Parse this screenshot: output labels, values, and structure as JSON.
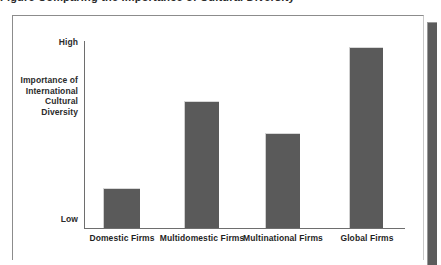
{
  "clipped_heading": "Figure   Comparing the Importance of Cultural Diversity",
  "chart_data": {
    "type": "bar",
    "title": "",
    "xlabel": "",
    "ylabel": "Importance of International Cultural Diversity",
    "ylabel_lines": [
      "Importance of",
      "International",
      "Cultural",
      "Diversity"
    ],
    "categories": [
      "Domestic Firms",
      "Multidomestic Firms",
      "Multinational Firms",
      "Global Firms"
    ],
    "values": [
      21,
      68,
      51,
      96
    ],
    "ylim": [
      0,
      100
    ],
    "ytick_labels": [
      "High",
      "Low"
    ],
    "ytick_values": [
      100,
      0
    ],
    "grid": false,
    "legend": false,
    "bar_color": "#5a5a5a",
    "axis_color": "#6e6e6e"
  },
  "bars": [
    {
      "label": "Domestic Firms",
      "left": 103,
      "top": 188,
      "width": 37,
      "height": 40
    },
    {
      "label": "Multidomestic Firms",
      "left": 184,
      "top": 101,
      "width": 35,
      "height": 127
    },
    {
      "label": "Multinational Firms",
      "left": 265,
      "top": 133,
      "width": 35,
      "height": 95
    },
    {
      "label": "Global Firms",
      "left": 349,
      "top": 47,
      "width": 34,
      "height": 181
    }
  ],
  "category_labels": [
    {
      "text": "Domestic Firms",
      "left": 77,
      "width": 90
    },
    {
      "text": "Multidomestic Firms",
      "left": 151,
      "width": 102
    },
    {
      "text": "Multinational Firms",
      "left": 233,
      "width": 100
    },
    {
      "text": "Global Firms",
      "left": 323,
      "width": 88
    }
  ]
}
